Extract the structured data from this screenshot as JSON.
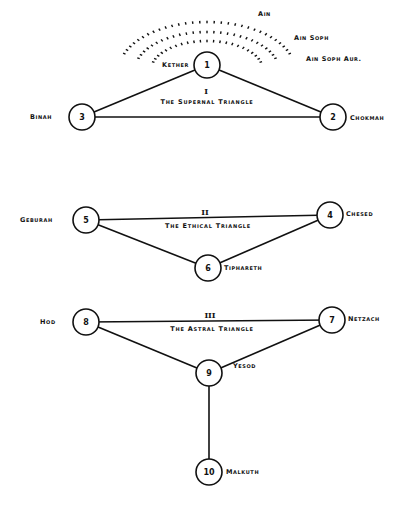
{
  "veils": [
    "Ain",
    "Ain Soph",
    "Ain Soph Aur."
  ],
  "sephiroth": [
    {
      "n": "1",
      "name": "Kether"
    },
    {
      "n": "2",
      "name": "Chokmah"
    },
    {
      "n": "3",
      "name": "Binah"
    },
    {
      "n": "4",
      "name": "Chesed"
    },
    {
      "n": "5",
      "name": "Geburah"
    },
    {
      "n": "6",
      "name": "Tiphareth"
    },
    {
      "n": "7",
      "name": "Netzach"
    },
    {
      "n": "8",
      "name": "Hod"
    },
    {
      "n": "9",
      "name": "Yesod"
    },
    {
      "n": "10",
      "name": "Malkuth"
    }
  ],
  "triangles": [
    {
      "numeral": "I",
      "name": "The Supernal Triangle"
    },
    {
      "numeral": "II",
      "name": "The Ethical Triangle"
    },
    {
      "numeral": "III",
      "name": "The Astral Triangle"
    }
  ]
}
